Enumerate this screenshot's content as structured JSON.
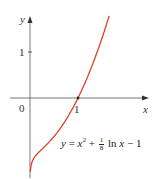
{
  "chart_data": {
    "type": "line",
    "title": "",
    "xlabel": "x",
    "ylabel": "y",
    "origin_label": "0",
    "x_ticks": [
      {
        "value": 1,
        "label": "1"
      }
    ],
    "y_ticks": [
      {
        "value": 1,
        "label": "1"
      }
    ],
    "grid": false,
    "series": [
      {
        "name": "y = x^2 + (1/8) ln x - 1",
        "color": "#e0402a",
        "function": "x^2 + ln(x)/8 - 1",
        "x_range": [
          0.008,
          1.65
        ],
        "x": [
          0.01,
          0.05,
          0.1,
          0.25,
          0.5,
          0.75,
          1.0,
          1.25,
          1.5,
          1.65
        ],
        "values": [
          -1.58,
          -1.37,
          -1.28,
          -1.11,
          -0.84,
          -0.47,
          0.0,
          0.59,
          1.3,
          1.78
        ]
      }
    ],
    "annotations": [
      {
        "text": "y = x² + ⅛ ln x − 1",
        "position": "lower right of curve"
      }
    ],
    "xlim": [
      -0.4,
      2.5
    ],
    "ylim": [
      -1.7,
      1.8
    ]
  },
  "labels": {
    "y_axis": "y",
    "x_axis": "x",
    "origin": "0",
    "x_tick_1": "1",
    "y_tick_1": "1",
    "eq_y": "y",
    "eq_eq": " = ",
    "eq_x": "x",
    "eq_sq": "2",
    "eq_plus": " + ",
    "eq_num": "1",
    "eq_den": "8",
    "eq_ln": " ln ",
    "eq_x2": "x",
    "eq_tail": " − 1"
  }
}
